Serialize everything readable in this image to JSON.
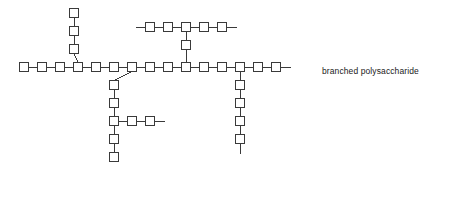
{
  "figure": {
    "background_color": "#ffffff",
    "width": 456,
    "height": 198
  },
  "caption": {
    "text": "branched polysaccharide",
    "x": 322,
    "y": 66,
    "color": "#1a1a1a",
    "font_size": 8.5
  },
  "style": {
    "monomer_stroke": "#3a3a3a",
    "monomer_fill": "#ffffff",
    "bond_stroke": "#3a3a3a",
    "stroke_width": 1,
    "monomer_size": 9,
    "pitch": 18
  },
  "legend": {
    "monomer_label": "monosaccharide unit (square)",
    "bond_label": "glycosidic bond (line)"
  },
  "chart_data": {
    "type": "diagram",
    "diagram_kind": "branched-polymer-schematic",
    "monomer_shape": "square",
    "monomer_size_px": 9,
    "unit_pitch_px": 18,
    "total_monomers": 34,
    "total_branch_points": 5,
    "chains": [
      {
        "name": "main-backbone",
        "orientation": "horizontal",
        "count": 15,
        "start_x": 24,
        "start_y": 67,
        "pitch": 18,
        "stub_start": false,
        "stub_end": true,
        "stub_length": 10,
        "branch_indices": [
          3,
          6,
          9,
          12
        ]
      },
      {
        "name": "upper-left-branch",
        "orientation": "vertical-up",
        "count": 3,
        "parent_chain": "main-backbone",
        "parent_index": 3,
        "start_x": 74,
        "start_y": 49,
        "pitch": 18,
        "stub_start": false,
        "stub_end": false
      },
      {
        "name": "upper-right-chain",
        "orientation": "horizontal",
        "count": 5,
        "start_x": 150,
        "start_y": 27,
        "pitch": 18,
        "stub_start": true,
        "stub_end": true,
        "stub_length": 10,
        "branch_indices": [
          2
        ]
      },
      {
        "name": "upper-right-connector",
        "orientation": "vertical-down",
        "count": 1,
        "parent_chain": "upper-right-chain",
        "parent_index": 2,
        "start_x": 186,
        "start_y": 45,
        "pitch": 18,
        "stub_start": false,
        "stub_end": false
      },
      {
        "name": "lower-left-branch",
        "orientation": "vertical-down",
        "count": 5,
        "parent_chain": "main-backbone",
        "parent_index": 6,
        "start_x": 114,
        "start_y": 85,
        "pitch": 18,
        "stub_start": false,
        "stub_end": false,
        "branch_indices": [
          2
        ]
      },
      {
        "name": "lower-left-side-chain",
        "orientation": "horizontal",
        "count": 2,
        "parent_chain": "lower-left-branch",
        "parent_index": 2,
        "start_x": 132,
        "start_y": 121,
        "pitch": 18,
        "stub_start": false,
        "stub_end": true,
        "stub_length": 10
      },
      {
        "name": "lower-right-branch",
        "orientation": "vertical-down",
        "count": 4,
        "parent_chain": "main-backbone",
        "parent_index": 12,
        "start_x": 240,
        "start_y": 85,
        "pitch": 18,
        "stub_start": false,
        "stub_end": true,
        "stub_length": 10
      }
    ],
    "annotations": [
      {
        "text": "branched polysaccharide",
        "x": 322,
        "y": 70,
        "anchor": "start"
      }
    ]
  }
}
